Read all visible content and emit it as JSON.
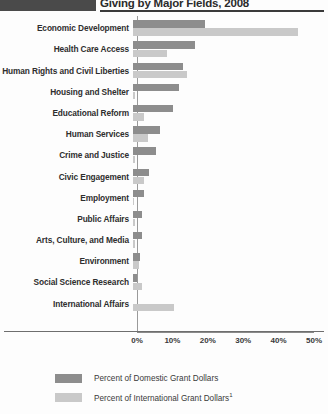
{
  "header": {
    "title": "Giving by Major Fields, 2008",
    "swatch_color": "#4a4a4a"
  },
  "colors": {
    "domestic": "#8d8d8d",
    "international": "#c9c9c9",
    "axis": "#8a8a8a",
    "text": "#2e2e2e"
  },
  "legend": {
    "position": "bottom-left",
    "items": [
      {
        "key": "domestic",
        "label": "Percent of Domestic Grant Dollars",
        "sup": ""
      },
      {
        "key": "international",
        "label": "Percent of International Grant Dollars",
        "sup": "1"
      }
    ]
  },
  "axis": {
    "ticks": [
      "0%",
      "10%",
      "20%",
      "30%",
      "40%",
      "50%"
    ],
    "tick_values": [
      0,
      10,
      20,
      30,
      40,
      50
    ]
  },
  "chart_data": {
    "type": "bar",
    "orientation": "horizontal",
    "title": "Giving by Major Fields, 2008",
    "xlabel": "",
    "ylabel": "",
    "xlim": [
      0,
      50
    ],
    "grid": false,
    "legend_position": "bottom-left",
    "categories": [
      "Economic Development",
      "Health Care Access",
      "Human Rights and Civil Liberties",
      "Housing and Shelter",
      "Educational Reform",
      "Human Services",
      "Crime and Justice",
      "Civic Engagement",
      "Employment",
      "Public Affairs",
      "Arts, Culture, and Media",
      "Environment",
      "Social Science Research",
      "International Affairs"
    ],
    "series": [
      {
        "name": "Percent of Domestic Grant Dollars",
        "color": "#8d8d8d",
        "values": [
          20.2,
          17.6,
          14.2,
          13.0,
          11.3,
          7.5,
          6.6,
          4.6,
          3.2,
          2.6,
          2.6,
          2.0,
          1.2,
          0.0
        ]
      },
      {
        "name": "Percent of International Grant Dollars",
        "color": "#c9c9c9",
        "values": [
          46.5,
          9.5,
          15.3,
          0.6,
          3.2,
          4.3,
          0.5,
          3.2,
          0.4,
          0.5,
          0.5,
          1.8,
          2.6,
          11.5
        ]
      }
    ]
  }
}
